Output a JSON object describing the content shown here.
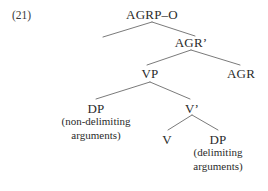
{
  "figure": {
    "example_number": "(21)",
    "type": "syntactic-tree-diagram"
  },
  "style": {
    "background_color": "#ffffff",
    "text_color": "#2b2b2b",
    "line_color": "#6b6b6b"
  },
  "tree": {
    "nodes": [
      {
        "id": "agrp-o",
        "label": "AGRP–O",
        "x": 152,
        "y": 8
      },
      {
        "id": "agr-bar",
        "label": "AGR’",
        "x": 191,
        "y": 36
      },
      {
        "id": "vp",
        "label": "VP",
        "x": 150,
        "y": 67
      },
      {
        "id": "agr",
        "label": "AGR",
        "x": 241,
        "y": 67
      },
      {
        "id": "dp-subject",
        "label": "DP",
        "x": 96,
        "y": 102
      },
      {
        "id": "v-bar",
        "label": "V’",
        "x": 192,
        "y": 102
      },
      {
        "id": "v",
        "label": "V",
        "x": 167,
        "y": 133
      },
      {
        "id": "dp-object",
        "label": "DP",
        "x": 218,
        "y": 133
      }
    ],
    "edges": [
      {
        "id": "agrp-o-to-left-specifier",
        "x1": 152,
        "y1": 22,
        "x2": 103,
        "y2": 37
      },
      {
        "id": "agrp-o-to-agr-bar",
        "x1": 152,
        "y1": 22,
        "x2": 195,
        "y2": 36
      },
      {
        "id": "agr-bar-to-vp",
        "x1": 191,
        "y1": 50,
        "x2": 147,
        "y2": 65
      },
      {
        "id": "agr-bar-to-agr",
        "x1": 191,
        "y1": 50,
        "x2": 240,
        "y2": 65
      },
      {
        "id": "vp-to-dp-subject",
        "x1": 150,
        "y1": 82,
        "x2": 96,
        "y2": 99
      },
      {
        "id": "vp-to-v-bar",
        "x1": 150,
        "y1": 82,
        "x2": 190,
        "y2": 99
      },
      {
        "id": "v-bar-to-v",
        "x1": 192,
        "y1": 115,
        "x2": 168,
        "y2": 130
      },
      {
        "id": "v-bar-to-dp-object",
        "x1": 192,
        "y1": 115,
        "x2": 218,
        "y2": 130
      }
    ]
  },
  "annotations": [
    {
      "id": "non-delimiting-arguments",
      "lines": [
        "(non-delimiting",
        "arguments)"
      ],
      "x": 96,
      "y": 115
    },
    {
      "id": "delimiting-arguments",
      "lines": [
        "(delimiting",
        "arguments)"
      ],
      "x": 218,
      "y": 146
    }
  ]
}
